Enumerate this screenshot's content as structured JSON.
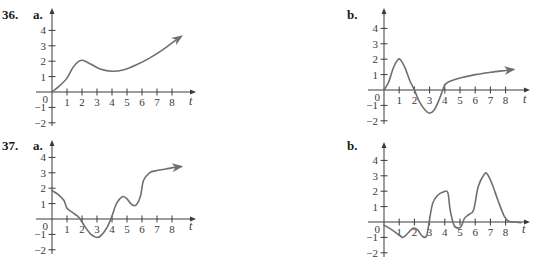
{
  "chart_data": [
    {
      "id": "36a",
      "type": "line",
      "problem_number": "36.",
      "part_label": "a.",
      "xlabel": "t",
      "ylabel": "",
      "xlim": [
        0,
        9
      ],
      "ylim": [
        -2,
        4.6
      ],
      "x_ticks": [
        "1",
        "2",
        "3",
        "4",
        "5",
        "6",
        "7",
        "8"
      ],
      "y_ticks": [
        "4",
        "3",
        "2",
        "1",
        "0",
        "−1",
        "−2"
      ],
      "y_tick_values": [
        4,
        3,
        2,
        1,
        0,
        -1,
        -2
      ],
      "grid": false,
      "curve_color": "#6f6f6f",
      "ends_with_arrow": true,
      "segments": [
        [
          [
            0,
            0
          ],
          [
            0.5,
            0.4
          ],
          [
            1,
            0.9
          ],
          [
            1.4,
            1.6
          ],
          [
            1.8,
            2.0
          ],
          [
            2.1,
            2.05
          ],
          [
            2.6,
            1.8
          ],
          [
            3.2,
            1.5
          ],
          [
            4,
            1.35
          ],
          [
            4.8,
            1.45
          ],
          [
            5.6,
            1.75
          ],
          [
            6.5,
            2.2
          ],
          [
            7.4,
            2.75
          ],
          [
            8.3,
            3.4
          ],
          [
            8.6,
            3.6
          ]
        ]
      ]
    },
    {
      "id": "36b",
      "type": "line",
      "problem_number": "",
      "part_label": "b.",
      "xlabel": "t",
      "ylabel": "",
      "xlim": [
        0,
        9
      ],
      "ylim": [
        -2,
        4.6
      ],
      "x_ticks": [
        "1",
        "2",
        "3",
        "4",
        "5",
        "6",
        "7",
        "8"
      ],
      "y_ticks": [
        "4",
        "3",
        "2",
        "1",
        "0",
        "−1",
        "−2"
      ],
      "y_tick_values": [
        4,
        3,
        2,
        1,
        0,
        -1,
        -2
      ],
      "grid": false,
      "curve_color": "#6f6f6f",
      "ends_with_arrow": true,
      "segments": [
        [
          [
            0,
            0
          ],
          [
            0.3,
            0.5
          ],
          [
            0.6,
            1.4
          ],
          [
            0.9,
            1.95
          ],
          [
            1.1,
            1.95
          ],
          [
            1.4,
            1.4
          ],
          [
            1.7,
            0.6
          ],
          [
            2,
            0
          ],
          [
            2.3,
            -0.7
          ],
          [
            2.7,
            -1.3
          ],
          [
            3,
            -1.5
          ],
          [
            3.3,
            -1.3
          ],
          [
            3.6,
            -0.7
          ],
          [
            3.9,
            0.1
          ],
          [
            4,
            0.35
          ]
        ],
        [
          [
            4,
            0.35
          ],
          [
            4.3,
            0.55
          ],
          [
            5,
            0.78
          ],
          [
            6,
            1.0
          ],
          [
            7,
            1.15
          ],
          [
            8,
            1.27
          ],
          [
            8.5,
            1.33
          ]
        ]
      ]
    },
    {
      "id": "37a",
      "type": "line",
      "problem_number": "37.",
      "part_label": "a.",
      "xlabel": "t",
      "ylabel": "",
      "xlim": [
        0,
        9
      ],
      "ylim": [
        -2,
        4.6
      ],
      "x_ticks": [
        "1",
        "2",
        "3",
        "4",
        "5",
        "6",
        "7",
        "8"
      ],
      "y_ticks": [
        "4",
        "3",
        "2",
        "1",
        "0",
        "−1",
        "−2"
      ],
      "y_tick_values": [
        4,
        3,
        2,
        1,
        0,
        -1,
        -2
      ],
      "grid": false,
      "curve_color": "#6f6f6f",
      "ends_with_arrow": true,
      "segments": [
        [
          [
            0,
            1.85
          ],
          [
            0.4,
            1.6
          ],
          [
            0.8,
            1.2
          ],
          [
            1,
            0.7
          ],
          [
            1.4,
            0.4
          ],
          [
            1.8,
            0.1
          ],
          [
            2.2,
            -0.5
          ],
          [
            2.6,
            -1.0
          ],
          [
            3,
            -1.2
          ],
          [
            3.3,
            -1.05
          ],
          [
            3.7,
            -0.5
          ],
          [
            4,
            0.2
          ],
          [
            4.3,
            1.0
          ],
          [
            4.7,
            1.45
          ],
          [
            5,
            1.3
          ],
          [
            5.3,
            0.95
          ],
          [
            5.6,
            0.9
          ],
          [
            5.9,
            1.5
          ],
          [
            6.1,
            2.5
          ],
          [
            6.5,
            3.0
          ],
          [
            7,
            3.15
          ],
          [
            7.6,
            3.25
          ],
          [
            8.2,
            3.35
          ],
          [
            8.6,
            3.4
          ]
        ]
      ]
    },
    {
      "id": "37b",
      "type": "line",
      "problem_number": "",
      "part_label": "b.",
      "xlabel": "t",
      "ylabel": "",
      "xlim": [
        0,
        9
      ],
      "ylim": [
        -2,
        4.6
      ],
      "x_ticks": [
        "1",
        "2",
        "3",
        "4",
        "5",
        "6",
        "7",
        "8"
      ],
      "y_ticks": [
        "4",
        "3",
        "2",
        "1",
        "0",
        "−1",
        "−2"
      ],
      "y_tick_values": [
        4,
        3,
        2,
        1,
        0,
        -1,
        -2
      ],
      "grid": false,
      "curve_color": "#6f6f6f",
      "ends_with_arrow": false,
      "segments": [
        [
          [
            0,
            -0.2
          ],
          [
            0.5,
            -0.5
          ],
          [
            1,
            -0.85
          ],
          [
            1.25,
            -1.0
          ],
          [
            1.6,
            -0.7
          ],
          [
            1.9,
            -0.4
          ],
          [
            2.2,
            -0.5
          ],
          [
            2.5,
            -0.9
          ],
          [
            2.8,
            -0.9
          ],
          [
            3,
            0.2
          ],
          [
            3.2,
            1.2
          ],
          [
            3.5,
            1.7
          ],
          [
            3.9,
            1.95
          ],
          [
            4.2,
            1.9
          ],
          [
            4.35,
            0.8
          ],
          [
            4.6,
            -0.2
          ],
          [
            4.9,
            -0.4
          ],
          [
            5.1,
            -0.25
          ],
          [
            5.3,
            0.25
          ],
          [
            5.6,
            0.5
          ],
          [
            5.9,
            0.8
          ],
          [
            6.2,
            2.3
          ],
          [
            6.6,
            3.1
          ],
          [
            6.8,
            3.1
          ],
          [
            7.1,
            2.5
          ],
          [
            7.5,
            1.4
          ],
          [
            7.9,
            0.4
          ],
          [
            8.2,
            0.05
          ],
          [
            8.6,
            0
          ],
          [
            9,
            -0.05
          ]
        ]
      ]
    }
  ]
}
